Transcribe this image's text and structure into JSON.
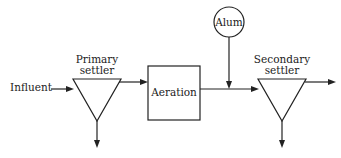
{
  "diagram": {
    "type": "process-flow",
    "nodes": {
      "influent": {
        "label": "Influent"
      },
      "primary_settler": {
        "label_line1": "Primary",
        "label_line2": "settler",
        "shape": "inverted-triangle"
      },
      "aeration": {
        "label": "Aeration",
        "shape": "rectangle"
      },
      "alum": {
        "label": "Alum",
        "shape": "circle"
      },
      "secondary_settler": {
        "label_line1": "Secondary",
        "label_line2": "settler",
        "shape": "inverted-triangle"
      }
    },
    "edges": [
      {
        "from": "influent",
        "to": "primary_settler"
      },
      {
        "from": "primary_settler",
        "to": "aeration"
      },
      {
        "from": "primary_settler",
        "to": "sludge-out-primary"
      },
      {
        "from": "aeration",
        "to": "secondary_settler"
      },
      {
        "from": "alum",
        "to": "aeration-to-secondary-line"
      },
      {
        "from": "secondary_settler",
        "to": "effluent-out"
      },
      {
        "from": "secondary_settler",
        "to": "sludge-out-secondary"
      }
    ],
    "colors": {
      "line": "#222222",
      "background": "#ffffff"
    }
  }
}
